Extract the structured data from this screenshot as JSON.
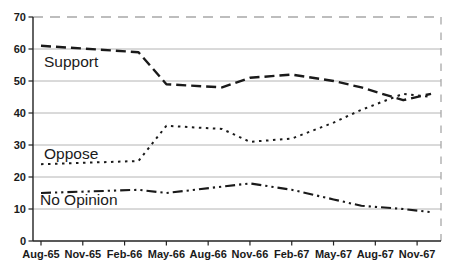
{
  "chart_data": {
    "type": "line",
    "title": "",
    "xlabel": "",
    "ylabel": "",
    "grid": "horizontal-gray",
    "legend": "inline-labels",
    "plot_border": "top-and-right-dashed",
    "x_tick_labels": [
      {
        "label": "Aug-65",
        "m": 0
      },
      {
        "label": "Nov-65",
        "m": 3
      },
      {
        "label": "Feb-66",
        "m": 6
      },
      {
        "label": "May-66",
        "m": 9
      },
      {
        "label": "Aug-66",
        "m": 12
      },
      {
        "label": "Nov-66",
        "m": 15
      },
      {
        "label": "Feb-67",
        "m": 18
      },
      {
        "label": "May-67",
        "m": 21
      },
      {
        "label": "Aug-67",
        "m": 24
      },
      {
        "label": "Nov-67",
        "m": 27
      }
    ],
    "y_axis": {
      "min": 0,
      "max": 70,
      "step": 10,
      "tick_labels": [
        "0",
        "10",
        "20",
        "30",
        "40",
        "50",
        "60",
        "70"
      ]
    },
    "series": [
      {
        "name": "Support",
        "line_style": "long-dash",
        "color": "#1a1a1a",
        "points": [
          {
            "date": "Aug-65",
            "m": 0,
            "v": 61
          },
          {
            "date": "Mar-66",
            "m": 7,
            "v": 59
          },
          {
            "date": "May-66",
            "m": 9,
            "v": 49
          },
          {
            "date": "Sep-66",
            "m": 13,
            "v": 48
          },
          {
            "date": "Nov-66",
            "m": 15,
            "v": 51
          },
          {
            "date": "Feb-67",
            "m": 18,
            "v": 52
          },
          {
            "date": "May-67",
            "m": 21,
            "v": 50
          },
          {
            "date": "Jul-67",
            "m": 23,
            "v": 48
          },
          {
            "date": "Oct-67",
            "m": 26,
            "v": 44
          },
          {
            "date": "Dec-67",
            "m": 28,
            "v": 46
          }
        ]
      },
      {
        "name": "Oppose",
        "line_style": "dotted",
        "color": "#1a1a1a",
        "points": [
          {
            "date": "Aug-65",
            "m": 0,
            "v": 24
          },
          {
            "date": "Mar-66",
            "m": 7,
            "v": 25
          },
          {
            "date": "May-66",
            "m": 9,
            "v": 36
          },
          {
            "date": "Sep-66",
            "m": 13,
            "v": 35
          },
          {
            "date": "Nov-66",
            "m": 15,
            "v": 31
          },
          {
            "date": "Feb-67",
            "m": 18,
            "v": 32
          },
          {
            "date": "May-67",
            "m": 21,
            "v": 37
          },
          {
            "date": "Jul-67",
            "m": 23,
            "v": 41
          },
          {
            "date": "Oct-67",
            "m": 26,
            "v": 46
          },
          {
            "date": "Dec-67",
            "m": 28,
            "v": 45
          }
        ]
      },
      {
        "name": "No Opinion",
        "line_style": "dash-dot-dot",
        "color": "#1a1a1a",
        "points": [
          {
            "date": "Aug-65",
            "m": 0,
            "v": 15
          },
          {
            "date": "Mar-66",
            "m": 7,
            "v": 16
          },
          {
            "date": "May-66",
            "m": 9,
            "v": 15
          },
          {
            "date": "Sep-66",
            "m": 13,
            "v": 17
          },
          {
            "date": "Nov-66",
            "m": 15,
            "v": 18
          },
          {
            "date": "Feb-67",
            "m": 18,
            "v": 16
          },
          {
            "date": "May-67",
            "m": 21,
            "v": 13
          },
          {
            "date": "Jul-67",
            "m": 23,
            "v": 11
          },
          {
            "date": "Oct-67",
            "m": 26,
            "v": 10
          },
          {
            "date": "Dec-67",
            "m": 28,
            "v": 9
          }
        ]
      }
    ],
    "annotations": [
      {
        "text": "Support",
        "x": 44,
        "y": 67
      },
      {
        "text": "Oppose",
        "x": 44,
        "y": 159
      },
      {
        "text": "No Opinion",
        "x": 40,
        "y": 205
      }
    ]
  },
  "colors": {
    "line": "#1a1a1a",
    "grid": "#b4b4b4",
    "border_dashed": "#a8a8a8",
    "axis": "#222222",
    "text": "#1a1a1a",
    "background": "#ffffff"
  }
}
